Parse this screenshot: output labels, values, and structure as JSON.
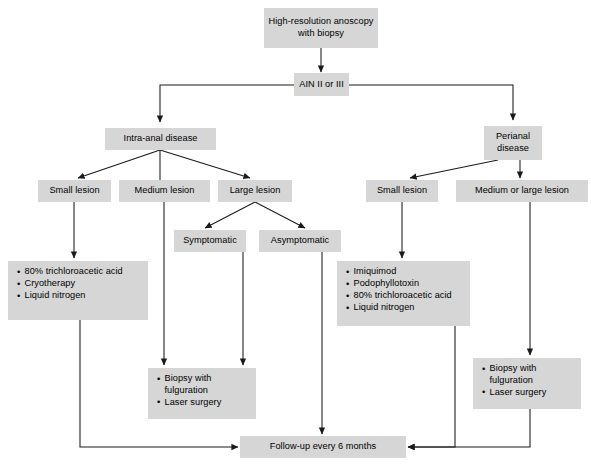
{
  "diagram": {
    "box_fill": "#d6d6d6",
    "line_color": "#1a1a1a",
    "nodes": {
      "hra": "High-resolution anoscopy\nwith biopsy",
      "ain": "AIN II or III",
      "intraanal": "Intra-anal disease",
      "perianal": "Perianal\ndisease",
      "intra_small": "Small lesion",
      "intra_medium": "Medium lesion",
      "intra_large": "Large lesion",
      "peri_small": "Small lesion",
      "peri_medlarge": "Medium or large lesion",
      "symptomatic": "Symptomatic",
      "asymptomatic": "Asymptomatic",
      "followup": "Follow-up every 6 months"
    },
    "lists": {
      "intra_small_tx": [
        "80% trichloroacetic acid",
        "Cryotherapy",
        "Liquid nitrogen"
      ],
      "intra_surgery_tx": [
        "Biopsy with\nfulguration",
        "Laser surgery"
      ],
      "peri_small_tx": [
        "Imiquimod",
        "Podophyllotoxin",
        "80% trichloroacetic acid",
        "Liquid nitrogen"
      ],
      "peri_surgery_tx": [
        "Biopsy with\nfulguration",
        "Laser surgery"
      ]
    }
  }
}
